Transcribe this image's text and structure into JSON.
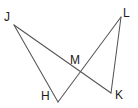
{
  "figure": {
    "kind": "geometry-diagram",
    "width": 138,
    "height": 108,
    "background_color": "#ffffff",
    "line_color": "#555555",
    "label_color": "#1b1b1b",
    "points": [
      {
        "name": "J",
        "label": "J",
        "x": 14,
        "y": 25
      },
      {
        "name": "L",
        "label": "L",
        "x": 121,
        "y": 17
      },
      {
        "name": "M",
        "label": "M",
        "x": 73,
        "y": 74
      },
      {
        "name": "H",
        "label": "H",
        "x": 58,
        "y": 102
      },
      {
        "name": "K",
        "label": "K",
        "x": 111,
        "y": 93
      }
    ],
    "segments": [
      {
        "name": "segment-JH",
        "from": "J",
        "to": "H",
        "path": "M 14 25 L 58 102"
      },
      {
        "name": "segment-JK",
        "from": "J",
        "to": "K",
        "path": "M 14 25 L 111 93"
      },
      {
        "name": "segment-LK",
        "from": "L",
        "to": "K",
        "path": "M 121 17 L 111 93"
      },
      {
        "name": "segment-LH",
        "from": "L",
        "to": "H",
        "path": "M 121 17 L 58 102"
      }
    ]
  }
}
